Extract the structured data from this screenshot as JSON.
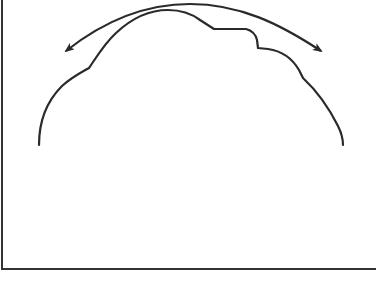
{
  "diagram": {
    "colors": {
      "stroke": "#2a2a2a",
      "frame": "#333333",
      "background": "#ffffff"
    },
    "elements": [
      {
        "id": "frame",
        "type": "border",
        "sides": [
          "left",
          "bottom"
        ]
      },
      {
        "id": "dome-outline",
        "type": "curve",
        "shape": "bumpy dome with notch on upper right"
      },
      {
        "id": "double-arrow",
        "type": "curved-arrow",
        "heads": [
          "left",
          "right"
        ]
      }
    ]
  }
}
